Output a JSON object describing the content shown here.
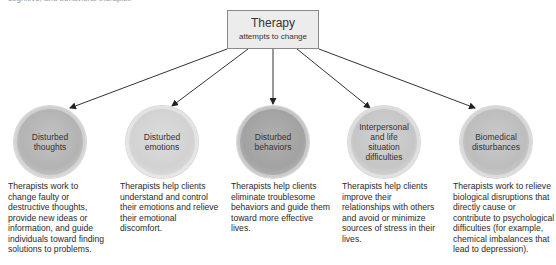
{
  "top_partial_text": "cognitive, and behavioral therapist.",
  "root": {
    "title": "Therapy",
    "subtitle": "attempts to change"
  },
  "nodes": [
    {
      "label": "Disturbed thoughts",
      "description": "Therapists work to change faulty or destructive thoughts, provide new ideas or information, and guide individuals toward finding solutions to problems."
    },
    {
      "label": "Disturbed emotions",
      "description": "Therapists help clients understand and control their emotions and relieve their emotional discomfort."
    },
    {
      "label": "Disturbed behaviors",
      "description": "Therapists help clients eliminate troublesome behaviors and guide them toward more effective lives."
    },
    {
      "label": "Interpersonal and life situation difficulties",
      "description": "Therapists help clients improve their relationships with others and avoid or minimize sources of stress in their lives."
    },
    {
      "label": "Biomedical disturbances",
      "description": "Therapists work to relieve biological disruptions that directly cause or contribute to psychological difficulties (for example, chemical imbalances that lead to depression)."
    }
  ],
  "colors": {
    "box_fill": "#ececec",
    "box_border": "#8a8a8a",
    "arrow": "#222222"
  }
}
